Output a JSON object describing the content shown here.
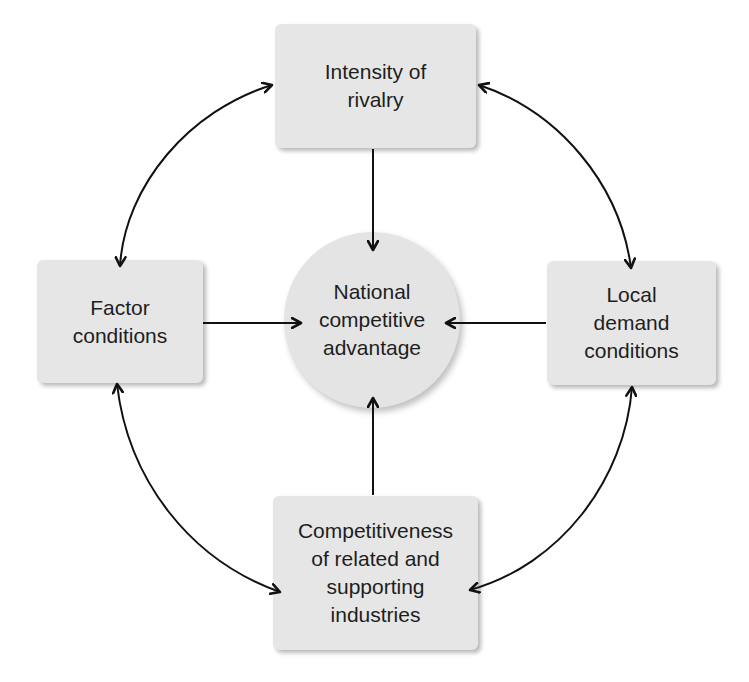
{
  "diagram": {
    "type": "porter-diamond",
    "nodes": {
      "top": {
        "id": "intensity-of-rivalry",
        "label": "Intensity of\nrivalry",
        "shape": "rounded-rectangle"
      },
      "left": {
        "id": "factor-conditions",
        "label": "Factor\nconditions",
        "shape": "rounded-rectangle"
      },
      "center": {
        "id": "national-competitive-advantage",
        "label": "National\ncompetitive\nadvantage",
        "shape": "circle"
      },
      "right": {
        "id": "local-demand-conditions",
        "label": "Local\ndemand\nconditions",
        "shape": "rounded-rectangle"
      },
      "bottom": {
        "id": "competitiveness-related-supporting-industries",
        "label": "Competitiveness\nof related and\nsupporting\nindustries",
        "shape": "rounded-rectangle"
      }
    },
    "edges": [
      {
        "from": "intensity-of-rivalry",
        "to": "national-competitive-advantage",
        "style": "straight",
        "direction": "one-way"
      },
      {
        "from": "factor-conditions",
        "to": "national-competitive-advantage",
        "style": "straight",
        "direction": "one-way"
      },
      {
        "from": "local-demand-conditions",
        "to": "national-competitive-advantage",
        "style": "straight",
        "direction": "one-way"
      },
      {
        "from": "competitiveness-related-supporting-industries",
        "to": "national-competitive-advantage",
        "style": "straight",
        "direction": "one-way"
      },
      {
        "from": "intensity-of-rivalry",
        "to": "factor-conditions",
        "style": "curved",
        "direction": "two-way"
      },
      {
        "from": "intensity-of-rivalry",
        "to": "local-demand-conditions",
        "style": "curved",
        "direction": "two-way"
      },
      {
        "from": "factor-conditions",
        "to": "competitiveness-related-supporting-industries",
        "style": "curved",
        "direction": "two-way"
      },
      {
        "from": "local-demand-conditions",
        "to": "competitiveness-related-supporting-industries",
        "style": "curved",
        "direction": "two-way"
      }
    ],
    "colors": {
      "node_fill": "#e6e6e6",
      "text": "#1e1e1e",
      "arrow": "#111111",
      "background": "#ffffff"
    }
  }
}
